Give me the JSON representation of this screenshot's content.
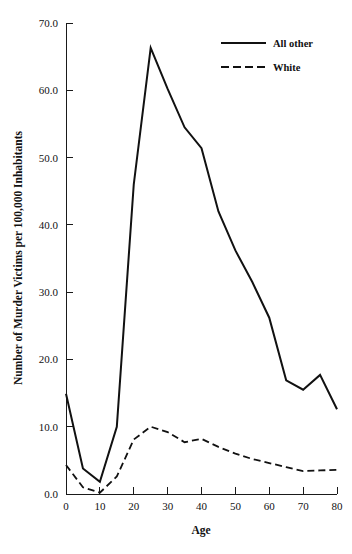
{
  "chart_data": {
    "type": "line",
    "title": "",
    "xlabel": "Age",
    "ylabel": "Number of Murder Victims per 100,000 Inhabitants",
    "xlim": [
      0,
      80
    ],
    "ylim": [
      0.0,
      70.0
    ],
    "grid": false,
    "legend_position": "top-right",
    "x": [
      0,
      5,
      10,
      15,
      20,
      25,
      30,
      35,
      40,
      45,
      50,
      55,
      60,
      65,
      70,
      75,
      80
    ],
    "xticks": [
      "0",
      "10",
      "20",
      "30",
      "40",
      "50",
      "60",
      "70",
      "80"
    ],
    "xtick_values": [
      0,
      10,
      20,
      30,
      40,
      50,
      60,
      70,
      80
    ],
    "yticks": [
      "0.0",
      "10.0",
      "20.0",
      "30.0",
      "40.0",
      "50.0",
      "60.0",
      "70.0"
    ],
    "ytick_values": [
      0.0,
      10.0,
      20.0,
      30.0,
      40.0,
      50.0,
      60.0,
      70.0
    ],
    "series": [
      {
        "name": "All other",
        "style": "solid",
        "color": "#111111",
        "values": [
          14.9,
          3.8,
          1.8,
          10.0,
          46.0,
          66.3,
          60.2,
          54.5,
          51.4,
          42.0,
          36.2,
          31.5,
          26.2,
          16.9,
          15.5,
          17.7,
          12.6
        ]
      },
      {
        "name": "White",
        "style": "dashed",
        "color": "#111111",
        "values": [
          4.3,
          1.0,
          0.2,
          2.6,
          8.1,
          10.0,
          9.2,
          7.7,
          8.2,
          7.0,
          6.0,
          5.2,
          4.6,
          4.0,
          3.4,
          3.5,
          3.6
        ]
      }
    ]
  },
  "legend": {
    "items": [
      {
        "label": "All other",
        "style": "solid"
      },
      {
        "label": "White",
        "style": "dashed"
      }
    ]
  }
}
